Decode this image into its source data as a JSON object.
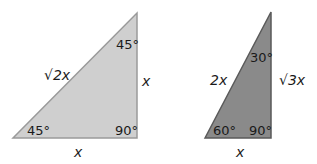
{
  "colors": {
    "triangle_45": "#cfcfcf",
    "triangle_30_60": "#8a8a8a",
    "edge_45": "#9a9a9a",
    "edge_30_60": "#5a5a5a"
  },
  "triangle_45_45_90": {
    "angle_top": "45°",
    "angle_bottom_left": "45°",
    "angle_right": "90°",
    "hypotenuse": "√2x",
    "vertical_leg": "x",
    "horizontal_leg": "x"
  },
  "triangle_30_60_90": {
    "angle_top": "30°",
    "angle_bottom_left": "60°",
    "angle_right": "90°",
    "hypotenuse": "2x",
    "vertical_leg": "√3x",
    "horizontal_leg": "x"
  }
}
